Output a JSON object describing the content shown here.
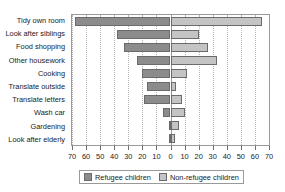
{
  "chart_data": {
    "type": "bar",
    "orientation": "horizontal",
    "subtype": "diverging-bidirectional",
    "title": "",
    "xlabel": "",
    "ylabel": "",
    "categories": [
      "Tidy own room",
      "Look after siblings",
      "Food shopping",
      "Other housework",
      "Cooking",
      "Translate outside",
      "Translate letters",
      "Wash car",
      "Gardening",
      "Look after elderly"
    ],
    "series": [
      {
        "name": "Refugee children",
        "direction": "left",
        "color": "#8c8c8c",
        "values": [
          68,
          38,
          33,
          24,
          20,
          17,
          19,
          5,
          1,
          1
        ]
      },
      {
        "name": "Non-refugee children",
        "direction": "right",
        "color": "#c4c4c4",
        "values": [
          65,
          20,
          27,
          33,
          12,
          4,
          8,
          10,
          6,
          3
        ]
      }
    ],
    "axis_max": 70,
    "tick_step": 10,
    "xticks_left": [
      70,
      60,
      50,
      40,
      30,
      20,
      10
    ],
    "xticks_center": [
      0
    ],
    "xticks_right": [
      10,
      20,
      30,
      40,
      50,
      60,
      70
    ],
    "xtick_labels": [
      "70",
      "60",
      "50",
      "40",
      "30",
      "20",
      "10",
      "0",
      "10",
      "20",
      "30",
      "40",
      "50",
      "60",
      "70"
    ],
    "grid": true,
    "legend_position": "bottom"
  },
  "legend": {
    "items": [
      {
        "label": "Refugee children"
      },
      {
        "label": "Non-refugee children"
      }
    ]
  }
}
